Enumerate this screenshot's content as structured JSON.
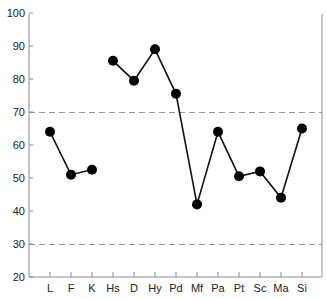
{
  "chart_data": {
    "type": "line",
    "title": "",
    "xlabel": "",
    "ylabel": "",
    "ylim": [
      20,
      100
    ],
    "yticks": [
      20,
      30,
      40,
      50,
      60,
      70,
      80,
      90,
      100
    ],
    "categories": [
      "L",
      "F",
      "K",
      "Hs",
      "D",
      "Hy",
      "Pd",
      "Mf",
      "Pa",
      "Pt",
      "Sc",
      "Ma",
      "Si"
    ],
    "values": [
      64,
      51,
      52.5,
      85.5,
      79.5,
      89,
      75.5,
      42,
      64,
      50.5,
      52,
      44,
      65
    ],
    "segments": [
      {
        "from": "L",
        "to": "K"
      },
      {
        "from": "Hs",
        "to": "Si"
      }
    ],
    "reference_lines": [
      {
        "value": 70,
        "style": "dashed"
      },
      {
        "value": 30,
        "style": "dashed"
      }
    ],
    "grid": false,
    "legend": null,
    "colors": {
      "line": "#111111",
      "marker": "#000000",
      "axis": "#8a8a8a",
      "reference": "#9a9a9a"
    }
  }
}
